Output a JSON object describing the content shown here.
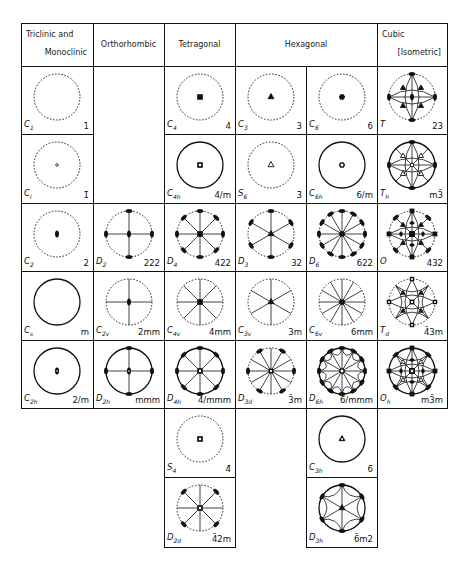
{
  "headers": [
    {
      "id": "tri",
      "line1": "Triclinic  and",
      "line2": "Monoclinic"
    },
    {
      "id": "ortho",
      "line1": "Orthorhombic"
    },
    {
      "id": "tetra",
      "line1": "Tetragonal"
    },
    {
      "id": "hex",
      "line1": "Hexagonal"
    },
    {
      "id": "cubic",
      "line1": "Cubic",
      "line2": "[Isometric]"
    }
  ],
  "groups": [
    {
      "sch": "C",
      "sub": "1",
      "hm": "1",
      "col": 0,
      "row": 0,
      "type": "c1"
    },
    {
      "sch": "C",
      "sub": "4",
      "hm": "4",
      "col": 2,
      "row": 0,
      "type": "c4"
    },
    {
      "sch": "C",
      "sub": "3",
      "hm": "3",
      "col": 3,
      "row": 0,
      "type": "c3"
    },
    {
      "sch": "C",
      "sub": "6",
      "hm": "6",
      "col": 4,
      "row": 0,
      "type": "c6"
    },
    {
      "sch": "T",
      "sub": "",
      "hm": "23",
      "col": 5,
      "row": 0,
      "type": "T"
    },
    {
      "sch": "C",
      "sub": "i",
      "hm": "1̄",
      "col": 0,
      "row": 1,
      "type": "ci"
    },
    {
      "sch": "C",
      "sub": "4h",
      "hm": "4/m",
      "col": 2,
      "row": 1,
      "type": "c4h"
    },
    {
      "sch": "S",
      "sub": "6",
      "hm": "3̄",
      "col": 3,
      "row": 1,
      "type": "s6"
    },
    {
      "sch": "C",
      "sub": "6h",
      "hm": "6/m",
      "col": 4,
      "row": 1,
      "type": "c6h"
    },
    {
      "sch": "T",
      "sub": "h",
      "hm": "m3̄",
      "col": 5,
      "row": 1,
      "type": "Th"
    },
    {
      "sch": "C",
      "sub": "2",
      "hm": "2",
      "col": 0,
      "row": 2,
      "type": "c2"
    },
    {
      "sch": "D",
      "sub": "2",
      "hm": "222",
      "col": 1,
      "row": 2,
      "type": "d2"
    },
    {
      "sch": "D",
      "sub": "4",
      "hm": "422",
      "col": 2,
      "row": 2,
      "type": "d4"
    },
    {
      "sch": "D",
      "sub": "3",
      "hm": "32",
      "col": 3,
      "row": 2,
      "type": "d3"
    },
    {
      "sch": "D",
      "sub": "6",
      "hm": "622",
      "col": 4,
      "row": 2,
      "type": "d6"
    },
    {
      "sch": "O",
      "sub": "",
      "hm": "432",
      "col": 5,
      "row": 2,
      "type": "O"
    },
    {
      "sch": "C",
      "sub": "s",
      "hm": "m",
      "col": 0,
      "row": 3,
      "type": "cs"
    },
    {
      "sch": "C",
      "sub": "2v",
      "hm": "2mm",
      "col": 1,
      "row": 3,
      "type": "c2v"
    },
    {
      "sch": "C",
      "sub": "4v",
      "hm": "4mm",
      "col": 2,
      "row": 3,
      "type": "c4v"
    },
    {
      "sch": "C",
      "sub": "3v",
      "hm": "3m",
      "col": 3,
      "row": 3,
      "type": "c3v"
    },
    {
      "sch": "C",
      "sub": "6v",
      "hm": "6mm",
      "col": 4,
      "row": 3,
      "type": "c6v"
    },
    {
      "sch": "T",
      "sub": "d",
      "hm": "4̄3m",
      "col": 5,
      "row": 3,
      "type": "Td"
    },
    {
      "sch": "C",
      "sub": "2h",
      "hm": "2/m",
      "col": 0,
      "row": 4,
      "type": "c2h"
    },
    {
      "sch": "D",
      "sub": "2h",
      "hm": "mmm",
      "col": 1,
      "row": 4,
      "type": "d2h"
    },
    {
      "sch": "D",
      "sub": "4h",
      "hm": "4/mmm",
      "col": 2,
      "row": 4,
      "type": "d4h"
    },
    {
      "sch": "D",
      "sub": "3d",
      "hm": "3̄m",
      "col": 3,
      "row": 4,
      "type": "d3d"
    },
    {
      "sch": "D",
      "sub": "6h",
      "hm": "6/mmm",
      "col": 4,
      "row": 4,
      "type": "d6h"
    },
    {
      "sch": "O",
      "sub": "h",
      "hm": "m3̄m",
      "col": 5,
      "row": 4,
      "type": "Oh"
    },
    {
      "sch": "S",
      "sub": "4",
      "hm": "4̄",
      "col": 2,
      "row": 5,
      "type": "s4"
    },
    {
      "sch": "C",
      "sub": "3h",
      "hm": "6̄",
      "col": 4,
      "row": 5,
      "type": "c3h"
    },
    {
      "sch": "D",
      "sub": "2d",
      "hm": "4̄2m",
      "col": 2,
      "row": 6,
      "type": "d2d"
    },
    {
      "sch": "D",
      "sub": "3h",
      "hm": "6̄m2",
      "col": 4,
      "row": 6,
      "type": "d3h"
    }
  ]
}
